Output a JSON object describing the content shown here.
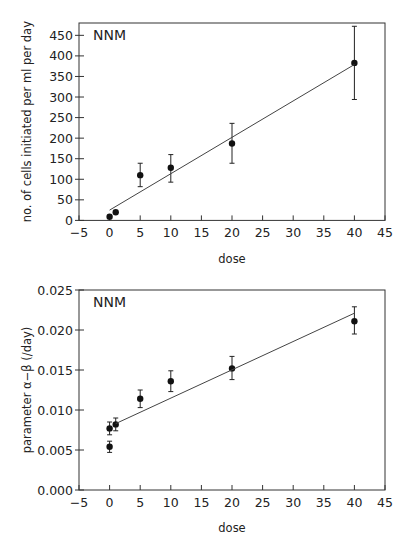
{
  "chart_data": [
    {
      "type": "scatter",
      "panel_label": "NNM",
      "title": "",
      "xlabel": "dose",
      "ylabel": "no. of cells initiated per ml per day",
      "xlim": [
        -5,
        45
      ],
      "ylim": [
        0,
        480
      ],
      "xticks": [
        -5,
        0,
        5,
        10,
        15,
        20,
        25,
        30,
        35,
        40,
        45
      ],
      "yticks": [
        0,
        50,
        100,
        150,
        200,
        250,
        300,
        350,
        400,
        450
      ],
      "grid": false,
      "legend": null,
      "series": [
        {
          "name": "observed",
          "points": [
            {
              "x": 0,
              "y": 9,
              "err_low": null,
              "err_high": null
            },
            {
              "x": 1,
              "y": 20,
              "err_low": null,
              "err_high": null
            },
            {
              "x": 5,
              "y": 110,
              "err_low": 82,
              "err_high": 139
            },
            {
              "x": 10,
              "y": 128,
              "err_low": 93,
              "err_high": 160
            },
            {
              "x": 20,
              "y": 187,
              "err_low": 139,
              "err_high": 236
            },
            {
              "x": 40,
              "y": 383,
              "err_low": 294,
              "err_high": 472
            }
          ]
        },
        {
          "name": "fit",
          "line": [
            {
              "x": 0,
              "y": 25
            },
            {
              "x": 40,
              "y": 379
            }
          ]
        }
      ]
    },
    {
      "type": "scatter",
      "panel_label": "NNM",
      "title": "",
      "xlabel": "dose",
      "ylabel": "parameter α−β (/day)",
      "xlim": [
        -5,
        45
      ],
      "ylim": [
        0,
        0.025
      ],
      "xticks": [
        -5,
        0,
        5,
        10,
        15,
        20,
        25,
        30,
        35,
        40,
        45
      ],
      "yticks": [
        0.0,
        0.005,
        0.01,
        0.015,
        0.02,
        0.025
      ],
      "ytick_labels": [
        "0.000",
        "0.005",
        "0.010",
        "0.015",
        "0.020",
        "0.025"
      ],
      "grid": false,
      "legend": null,
      "series": [
        {
          "name": "observed",
          "points": [
            {
              "x": 0,
              "y": 0.0077,
              "err_low": 0.0069,
              "err_high": 0.0085
            },
            {
              "x": 0,
              "y": 0.0054,
              "err_low": 0.0047,
              "err_high": 0.0061
            },
            {
              "x": 1,
              "y": 0.0082,
              "err_low": 0.0074,
              "err_high": 0.009
            },
            {
              "x": 5,
              "y": 0.0114,
              "err_low": 0.0103,
              "err_high": 0.0125
            },
            {
              "x": 10,
              "y": 0.0136,
              "err_low": 0.0123,
              "err_high": 0.0149
            },
            {
              "x": 20,
              "y": 0.0152,
              "err_low": 0.0138,
              "err_high": 0.0167
            },
            {
              "x": 40,
              "y": 0.0211,
              "err_low": 0.0195,
              "err_high": 0.0229
            }
          ]
        },
        {
          "name": "fit",
          "line": [
            {
              "x": 1,
              "y": 0.0083
            },
            {
              "x": 40,
              "y": 0.0221
            }
          ]
        }
      ]
    }
  ]
}
